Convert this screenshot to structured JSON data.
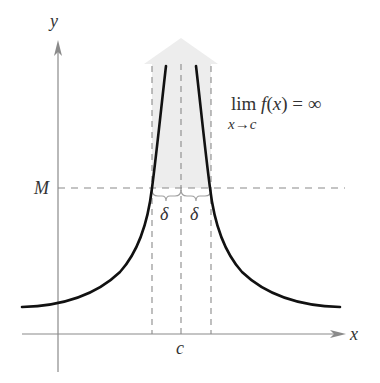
{
  "diagram": {
    "axes": {
      "x_label": "x",
      "y_label": "y",
      "color": "#8a8a8a"
    },
    "labels": {
      "M": "M",
      "c": "c",
      "delta_left": "δ",
      "delta_right": "δ",
      "limit_main": "lim f(x) = ∞",
      "limit_sub": "x→c"
    },
    "colors": {
      "curve": "#111111",
      "dashed": "#8a8a8a",
      "arrow_fill": "#ececec",
      "brace": "#a0a0a0",
      "text": "#333333"
    }
  }
}
